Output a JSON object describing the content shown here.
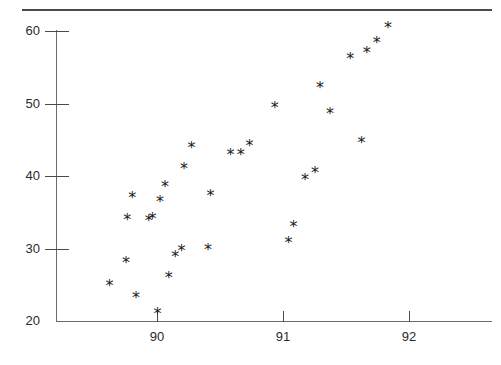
{
  "figure": {
    "width": 501,
    "height": 365,
    "background": "#ffffff",
    "rule_color": "#4a4a4a",
    "axis_color": "#6b6b6b",
    "marker_color": "#1a1a1a",
    "marker_glyph": "*"
  },
  "chart_data": {
    "type": "scatter",
    "title": "",
    "subtitle": "",
    "xlabel": "",
    "ylabel": "",
    "xlim": [
      89.45,
      92.25
    ],
    "ylim": [
      20,
      61.5
    ],
    "xticks": [
      90,
      91,
      92
    ],
    "xtick_labels": [
      "90",
      "91",
      "92"
    ],
    "yticks": [
      20,
      30,
      40,
      50,
      60
    ],
    "ytick_labels": [
      "20",
      "30",
      "40",
      "50",
      "60"
    ],
    "grid": false,
    "legend": null,
    "annotations": [],
    "series": [
      {
        "name": "series-1",
        "marker": "*",
        "color": "#1a1a1a",
        "points": [
          [
            89.62,
            24.8
          ],
          [
            89.75,
            28.0
          ],
          [
            89.76,
            33.9
          ],
          [
            89.8,
            37.0
          ],
          [
            89.83,
            23.2
          ],
          [
            89.93,
            33.8
          ],
          [
            89.96,
            34.1
          ],
          [
            90.0,
            20.9
          ],
          [
            90.02,
            36.4
          ],
          [
            90.06,
            38.5
          ],
          [
            90.09,
            25.9
          ],
          [
            90.14,
            28.8
          ],
          [
            90.19,
            29.6
          ],
          [
            90.21,
            41.0
          ],
          [
            90.27,
            43.9
          ],
          [
            90.4,
            29.8
          ],
          [
            90.42,
            37.2
          ],
          [
            90.58,
            42.9
          ],
          [
            90.66,
            42.9
          ],
          [
            90.73,
            44.2
          ],
          [
            90.93,
            49.4
          ],
          [
            91.04,
            30.7
          ],
          [
            91.08,
            32.9
          ],
          [
            91.17,
            39.5
          ],
          [
            91.25,
            40.4
          ],
          [
            91.29,
            52.1
          ],
          [
            91.37,
            48.6
          ],
          [
            91.53,
            56.1
          ],
          [
            91.62,
            44.6
          ],
          [
            91.66,
            57.0
          ],
          [
            91.74,
            58.4
          ],
          [
            91.83,
            60.4
          ]
        ]
      }
    ]
  },
  "axes": {
    "y_tick_items": [
      {
        "value": 60,
        "label": "60"
      },
      {
        "value": 50,
        "label": "50"
      },
      {
        "value": 40,
        "label": "40"
      },
      {
        "value": 30,
        "label": "30"
      },
      {
        "value": 20,
        "label": "20"
      }
    ],
    "x_tick_items": [
      {
        "value": 90,
        "label": "90"
      },
      {
        "value": 91,
        "label": "91"
      },
      {
        "value": 92,
        "label": "92"
      }
    ]
  }
}
